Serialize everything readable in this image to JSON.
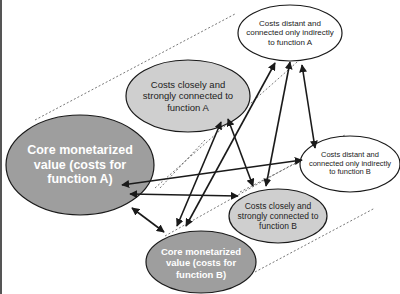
{
  "diagram": {
    "colors": {
      "background": "#ffffff",
      "core_fill": "#9e9e9e",
      "close_fill": "#cfcfcf",
      "distant_fill": "#ffffff",
      "stroke": "#1a1a1a",
      "dashed": "#555555",
      "core_text": "#ffffff",
      "other_text": "#222222"
    },
    "nodes": {
      "core_a": {
        "label": "Core monetarized value (costs for function A)",
        "lines": [
          "Core monetarized",
          "value (costs for",
          "function A)"
        ]
      },
      "close_a": {
        "label": "Costs closely and strongly connected to function A",
        "lines": [
          "Costs closely and",
          "strongly connected to",
          "function A"
        ]
      },
      "distant_a": {
        "label": "Costs distant and connected only indirectly to function A",
        "lines": [
          "Costs distant and",
          "connected only indirectly",
          "to function A"
        ]
      },
      "core_b": {
        "label": "Core monetarized value (costs for function B)",
        "lines": [
          "Core monetarized",
          "value (costs for",
          "function B)"
        ]
      },
      "close_b": {
        "label": "Costs closely and strongly connected to function B",
        "lines": [
          "Costs closely and",
          "strongly connected to",
          "function B"
        ]
      },
      "distant_b": {
        "label": "Costs distant and connected only indirectly to function B",
        "lines": [
          "Costs distant and",
          "connected only indirectly",
          "to function B"
        ]
      }
    },
    "connections": [
      {
        "from": "core_a",
        "to": "distant_b",
        "type": "bidirectional"
      },
      {
        "from": "core_a",
        "to": "close_b",
        "type": "bidirectional"
      },
      {
        "from": "core_a",
        "to": "core_b",
        "type": "bidirectional"
      },
      {
        "from": "close_a",
        "to": "close_b",
        "type": "bidirectional"
      },
      {
        "from": "close_a",
        "to": "core_b",
        "type": "bidirectional"
      },
      {
        "from": "distant_a",
        "to": "core_b",
        "type": "bidirectional"
      },
      {
        "from": "distant_a",
        "to": "close_b",
        "type": "bidirectional"
      },
      {
        "from": "distant_a",
        "to": "distant_b",
        "type": "bidirectional"
      }
    ]
  }
}
